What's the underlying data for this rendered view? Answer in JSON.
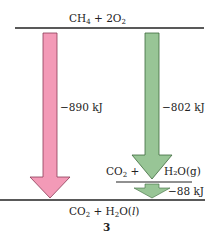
{
  "diagram": {
    "type": "energy-level-diagram",
    "top_state": {
      "species": [
        "CH",
        "4",
        " + 2O",
        "2"
      ]
    },
    "intermediate_state": {
      "left": [
        "CO",
        "2",
        " +"
      ],
      "right": "H₂O(g)"
    },
    "bottom_state": {
      "species": [
        "CO",
        "2",
        " + H",
        "2",
        "O(",
        "l",
        ")"
      ]
    },
    "arrows": [
      {
        "label": "−890 kJ",
        "color": "#f39ab7",
        "from": "CH₄ + 2O₂",
        "to": "CO₂ + H₂O(l)"
      },
      {
        "label": "−802 kJ",
        "color": "#98c596",
        "from": "CH₄ + 2O₂",
        "to": "CO₂ + H₂O(g)"
      },
      {
        "label": "−88 kJ",
        "color": "#98c596",
        "from": "CO₂ + H₂O(g)",
        "to": "CO₂ + H₂O(l)"
      }
    ],
    "figure_number": "3"
  }
}
